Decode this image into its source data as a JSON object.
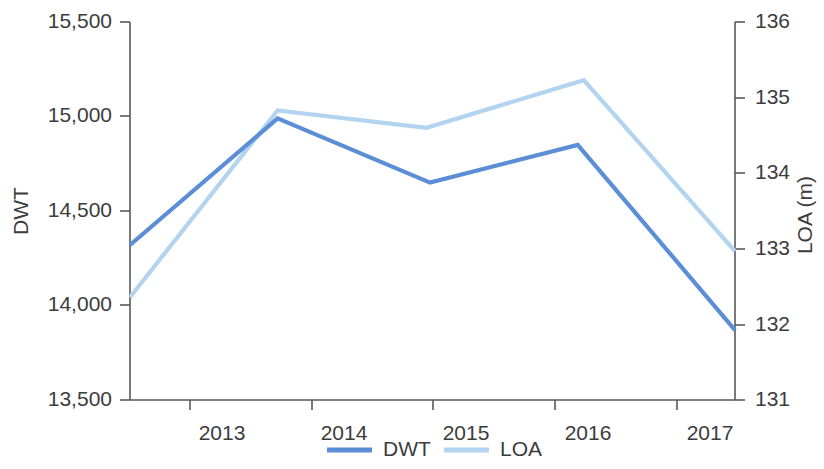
{
  "chart_data": {
    "type": "line",
    "title": "",
    "subtitle": "",
    "xlabel": "",
    "ylabel": "DWT",
    "y2label": "LOA (m)",
    "grid": false,
    "legend_position": "bottom",
    "x": [
      "2013",
      "2014",
      "2015",
      "2016",
      "2017"
    ],
    "categories": [
      "2013",
      "2014",
      "2015",
      "2016",
      "2017"
    ],
    "xlim": [
      2012.5,
      2017.5
    ],
    "ylim": [
      13500,
      15500
    ],
    "y2lim": [
      131,
      136
    ],
    "ytick_labels": [
      "15,500",
      "15,000",
      "14,500",
      "14,000",
      "13,500"
    ],
    "ytick_values": [
      15500,
      15000,
      14500,
      14000,
      13500
    ],
    "y2tick_labels": [
      "136",
      "135",
      "134",
      "133",
      "132",
      "131"
    ],
    "y2tick_values": [
      136,
      135,
      134,
      133,
      132,
      131
    ],
    "xtick_labels": [
      "2013",
      "2014",
      "2015",
      "2016",
      "2017"
    ],
    "series": [
      {
        "name": "DWT",
        "axis": "left",
        "color": "#5b8ed6",
        "x": [
          2012.5,
          2013.72,
          2014.98,
          2016.2,
          2017.5
        ],
        "values": [
          14320,
          14990,
          14650,
          14850,
          13870
        ]
      },
      {
        "name": "LOA",
        "axis": "right",
        "color": "#b2d4f0",
        "x": [
          2012.5,
          2013.72,
          2014.95,
          2016.25,
          2017.5
        ],
        "values": [
          132.36,
          134.83,
          134.6,
          135.23,
          132.97
        ]
      }
    ],
    "legend": [
      {
        "label": "DWT",
        "color": "#5b8ed6"
      },
      {
        "label": "LOA",
        "color": "#b2d4f0"
      }
    ]
  },
  "axes": {
    "left_title": "DWT",
    "right_title": "LOA (m)"
  },
  "ticks": {
    "left": {
      "t0": "15,500",
      "t1": "15,000",
      "t2": "14,500",
      "t3": "14,000",
      "t4": "13,500"
    },
    "right": {
      "t0": "136",
      "t1": "135",
      "t2": "134",
      "t3": "133",
      "t4": "132",
      "t5": "131"
    },
    "bottom": {
      "t0": "2013",
      "t1": "2014",
      "t2": "2015",
      "t3": "2016",
      "t4": "2017"
    }
  },
  "legend": {
    "dwt_label": "DWT",
    "loa_label": "LOA"
  },
  "colors": {
    "dwt": "#5b8ed6",
    "loa": "#b2d4f0",
    "axis": "#595959",
    "text": "#3c3c3c"
  }
}
